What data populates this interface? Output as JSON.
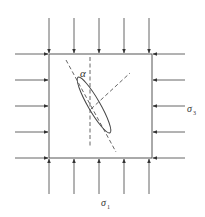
{
  "diagram": {
    "title": "",
    "labels": {
      "angle": "α",
      "sigma3": "σ",
      "sigma3_sub": "3",
      "sigma1": "σ",
      "sigma1_sub": "1"
    },
    "box": {
      "x": 49,
      "y": 54,
      "width": 103,
      "height": 104
    },
    "arrows": {
      "top_x": [
        49,
        74,
        99,
        124,
        149
      ],
      "bottom_x": [
        49,
        74,
        99,
        124,
        149
      ],
      "left_y": [
        54,
        80,
        106,
        132,
        158
      ],
      "right_y": [
        54,
        80,
        106,
        132,
        158
      ]
    },
    "colors": {
      "stroke": "#444444",
      "dashed": "#555555"
    }
  }
}
